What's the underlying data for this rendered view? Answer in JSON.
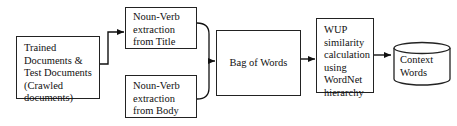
{
  "diagram": {
    "type": "flowchart",
    "nodes": [
      {
        "id": "docs",
        "shape": "rectangle",
        "lines": [
          "Trained",
          "Documents &",
          "Test Documents",
          "(Crawled",
          "documents)"
        ]
      },
      {
        "id": "title_extract",
        "shape": "rectangle",
        "lines": [
          "Noun-Verb",
          "extraction",
          "from Title"
        ]
      },
      {
        "id": "body_extract",
        "shape": "rectangle",
        "lines": [
          "Noun-Verb",
          "extraction",
          "from Body"
        ]
      },
      {
        "id": "bag",
        "shape": "rectangle",
        "lines": [
          "Bag of Words"
        ]
      },
      {
        "id": "wup",
        "shape": "rectangle",
        "lines": [
          "WUP",
          "similarity",
          "calculation",
          "using",
          "WordNet",
          "hierarchy"
        ]
      },
      {
        "id": "context",
        "shape": "cylinder",
        "lines": [
          "Context",
          "Words"
        ]
      }
    ],
    "edges": [
      {
        "from": "docs",
        "to": "title_extract",
        "style": "elbow-arrow"
      },
      {
        "from": "title_extract",
        "to": "bag",
        "style": "brace-merge"
      },
      {
        "from": "body_extract",
        "to": "bag",
        "style": "brace-merge"
      },
      {
        "from": "bag",
        "to": "wup",
        "style": "arrow"
      },
      {
        "from": "wup",
        "to": "context",
        "style": "arrow"
      }
    ],
    "colors": {
      "stroke": "#222222",
      "fill": "#ffffff",
      "text": "#111111"
    }
  }
}
